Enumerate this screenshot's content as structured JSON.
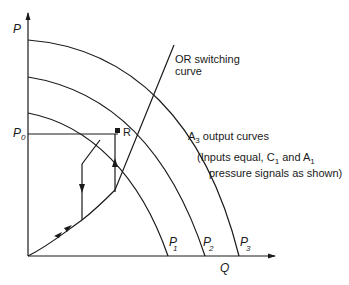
{
  "axes": {
    "y_label": "P",
    "x_label": "Q",
    "p0_label": "P",
    "p0_sub": "0"
  },
  "curves": [
    {
      "label": "P",
      "sub": "1"
    },
    {
      "label": "P",
      "sub": "2"
    },
    {
      "label": "P",
      "sub": "3"
    }
  ],
  "point_r": {
    "label": "R"
  },
  "annotations": {
    "switching_line1": "OR switching",
    "switching_line2": "curve",
    "output_prefix": "A",
    "output_sub": "3",
    "output_suffix": " output curves",
    "inputs_line1_a": "(Inputs equal, C",
    "inputs_line1_sub1": "1",
    "inputs_line1_b": " and A",
    "inputs_line1_sub2": "1",
    "inputs_line2": "pressure signals as shown)"
  }
}
